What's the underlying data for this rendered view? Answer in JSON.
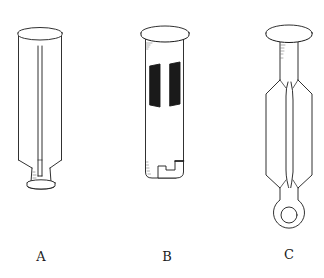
{
  "figure": {
    "background_color": "#ffffff",
    "ink_color": "#1a1a1a",
    "items": [
      {
        "id": "A",
        "label": "A",
        "parts": [
          "cap-disc",
          "cylindrical-body",
          "central-rod",
          "tapered-neck",
          "base-disc"
        ]
      },
      {
        "id": "B",
        "label": "B",
        "parts": [
          "cap-disc",
          "cylindrical-tube",
          "two-dark-bands",
          "l-shaped-slot"
        ]
      },
      {
        "id": "C",
        "label": "C",
        "parts": [
          "cap-disc",
          "neck",
          "split-hexagonal-body",
          "ring-eyelet"
        ]
      }
    ]
  }
}
